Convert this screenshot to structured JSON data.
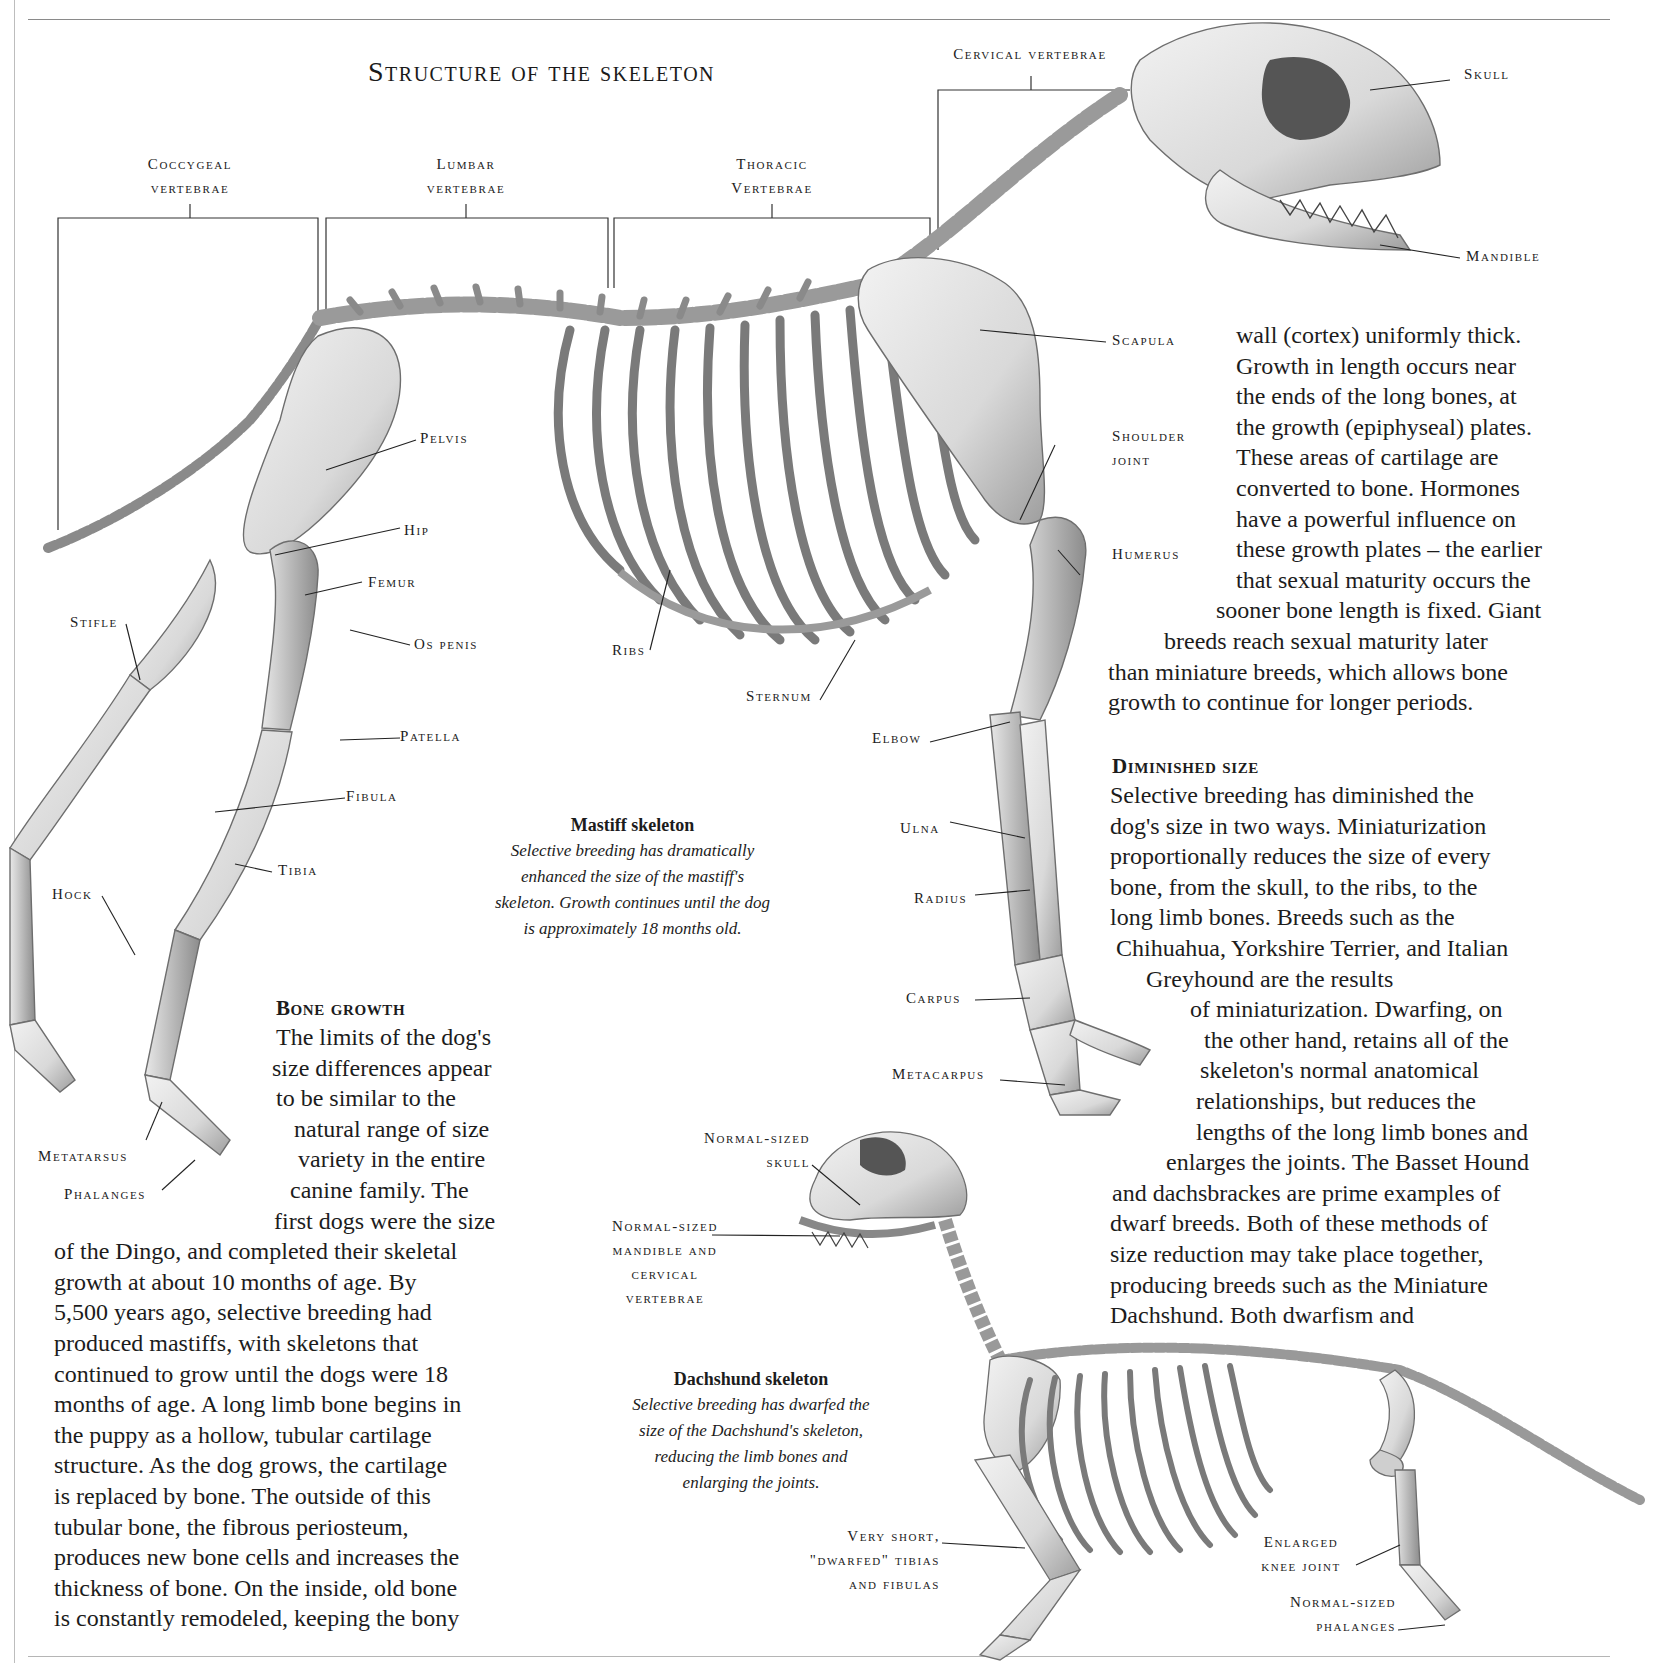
{
  "page": {
    "title": "Structure of the skeleton"
  },
  "vertebrae_labels": [
    {
      "id": "coccygeal",
      "lines": [
        "Coccygeal",
        "vertebrae"
      ]
    },
    {
      "id": "lumbar",
      "lines": [
        "Lumbar",
        "vertebrae"
      ]
    },
    {
      "id": "thoracic",
      "lines": [
        "Thoracic",
        "Vertebrae"
      ]
    },
    {
      "id": "cervical",
      "lines": [
        "Cervical vertebrae"
      ]
    }
  ],
  "mastiff_labels": {
    "skull": "Skull",
    "mandible": "Mandible",
    "scapula": "Scapula",
    "shoulder_joint": [
      "Shoulder",
      "joint"
    ],
    "humerus": "Humerus",
    "pelvis": "Pelvis",
    "hip": "Hip",
    "femur": "Femur",
    "stifle": "Stifle",
    "os_penis": "Os penis",
    "ribs": "Ribs",
    "sternum": "Sternum",
    "patella": "Patella",
    "elbow": "Elbow",
    "fibula": "Fibula",
    "ulna": "Ulna",
    "tibia": "Tibia",
    "hock": "Hock",
    "radius": "Radius",
    "carpus": "Carpus",
    "metacarpus": "Metacarpus",
    "metatarsus": "Metatarsus",
    "phalanges": "Phalanges"
  },
  "mastiff_caption": {
    "title": "Mastiff skeleton",
    "lines": [
      "Selective breeding has dramatically",
      "enhanced the size of the mastiff's",
      "skeleton. Growth continues until the dog",
      "is approximately 18 months old."
    ]
  },
  "dachshund_labels": {
    "normal_skull": [
      "Normal-sized",
      "skull"
    ],
    "normal_mandible": [
      "Normal-sized",
      "mandible and",
      "cervical",
      "vertebrae"
    ],
    "dwarfed_tibias": [
      "Very short,",
      "\"dwarfed\" tibias",
      "and fibulas"
    ],
    "enlarged_knee": [
      "Enlarged",
      "knee joint"
    ],
    "normal_phalanges": [
      "Normal-sized",
      "phalanges"
    ]
  },
  "dachshund_caption": {
    "title": "Dachshund skeleton",
    "lines": [
      "Selective breeding has dwarfed the",
      "size of the Dachshund's skeleton,",
      "reducing the limb bones and",
      "enlarging the joints."
    ]
  },
  "bone_growth": {
    "heading": "Bone growth",
    "lines": [
      "The limits of the dog's",
      "size differences appear",
      "to be similar to the",
      "natural range of size",
      "variety in the entire",
      "canine family. The",
      "first dogs were the size",
      "of the Dingo, and completed their skeletal",
      "growth at about 10 months of age. By",
      "5,500 years ago, selective breeding had",
      "produced mastiffs, with skeletons that",
      "continued to grow until the dogs were 18",
      "months of age. A long limb bone begins in",
      "the puppy as a hollow, tubular cartilage",
      "structure. As the dog grows, the cartilage",
      "is replaced by bone. The outside of this",
      "tubular bone, the fibrous periosteum,",
      "produces new bone cells and increases the",
      "thickness of bone. On the inside, old bone",
      "is constantly remodeled, keeping the bony"
    ]
  },
  "continued_text": {
    "lines": [
      "wall (cortex) uniformly thick.",
      "Growth in length occurs near",
      "the ends of the long bones, at",
      "the growth (epiphyseal) plates.",
      "These areas of cartilage are",
      "converted to bone. Hormones",
      "have a powerful influence on",
      "these growth plates – the earlier",
      "that sexual maturity occurs the",
      "sooner bone length is fixed. Giant",
      "breeds reach sexual maturity later",
      "than miniature breeds, which allows bone",
      "growth to continue for longer periods."
    ]
  },
  "diminished_size": {
    "heading": "Diminished size",
    "lines": [
      "Selective breeding has diminished the",
      "dog's size in two ways. Miniaturization",
      "proportionally reduces the size of every",
      "bone, from the skull, to the ribs, to the",
      "long limb bones. Breeds such as the",
      "Chihuahua, Yorkshire Terrier, and Italian",
      "Greyhound are the results",
      "of miniaturization. Dwarfing, on",
      "the other hand, retains all of the",
      "skeleton's normal anatomical",
      "relationships, but reduces the",
      "lengths of the long limb bones and",
      "enlarges the joints. The Basset Hound",
      "and dachsbrackes are prime examples of",
      "dwarf breeds. Both of these methods of",
      "size reduction may take place together,",
      "producing breeds such as the Miniature",
      "Dachshund. Both dwarfism and"
    ]
  }
}
